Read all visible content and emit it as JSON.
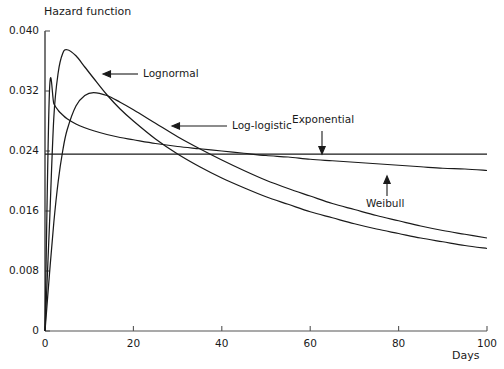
{
  "chart_data": {
    "type": "line",
    "title": "",
    "ylabel": "Hazard function",
    "xlabel": "Days",
    "xlim": [
      0,
      100
    ],
    "ylim": [
      0,
      0.04
    ],
    "grid": false,
    "legend_position": "inline-annotations",
    "xticks": [
      "0",
      "20",
      "40",
      "60",
      "80",
      "100"
    ],
    "xtick_values": [
      0,
      20,
      40,
      60,
      80,
      100
    ],
    "yticks": [
      "0",
      "0.008",
      "0.016",
      "0.024",
      "0.032",
      "0.040"
    ],
    "ytick_values": [
      0,
      0.008,
      0.016,
      0.024,
      0.032,
      0.04
    ],
    "x": [
      0,
      1,
      2,
      3,
      4,
      5,
      7,
      9,
      11,
      14,
      17,
      20,
      25,
      30,
      35,
      40,
      45,
      50,
      55,
      60,
      65,
      70,
      75,
      80,
      85,
      90,
      95,
      100
    ],
    "series": [
      {
        "name": "Lognormal",
        "values": [
          0.0,
          0.014,
          0.0285,
          0.0345,
          0.037,
          0.0375,
          0.0367,
          0.0352,
          0.0337,
          0.0315,
          0.0296,
          0.028,
          0.0256,
          0.0236,
          0.0219,
          0.0204,
          0.0191,
          0.0179,
          0.0169,
          0.0159,
          0.0151,
          0.0143,
          0.0136,
          0.013,
          0.0124,
          0.0119,
          0.0114,
          0.011
        ]
      },
      {
        "name": "Log-logistic",
        "values": [
          0.0,
          0.0075,
          0.0145,
          0.02,
          0.024,
          0.0268,
          0.03,
          0.0314,
          0.0318,
          0.0314,
          0.0305,
          0.0295,
          0.0277,
          0.0259,
          0.0243,
          0.0228,
          0.0214,
          0.0201,
          0.019,
          0.018,
          0.017,
          0.0162,
          0.0154,
          0.0147,
          0.014,
          0.0134,
          0.0129,
          0.0124
        ]
      },
      {
        "name": "Exponential",
        "values": [
          0.0236,
          0.0236,
          0.0236,
          0.0236,
          0.0236,
          0.0236,
          0.0236,
          0.0236,
          0.0236,
          0.0236,
          0.0236,
          0.0236,
          0.0236,
          0.0236,
          0.0236,
          0.0236,
          0.0236,
          0.0236,
          0.0236,
          0.0236,
          0.0236,
          0.0236,
          0.0236,
          0.0236,
          0.0236,
          0.0236,
          0.0236,
          0.0236
        ]
      },
      {
        "name": "Weibull",
        "values": [
          0.0,
          0.0318,
          0.0303,
          0.0294,
          0.0288,
          0.0283,
          0.0276,
          0.0271,
          0.0267,
          0.0262,
          0.0258,
          0.0255,
          0.025,
          0.0246,
          0.0243,
          0.024,
          0.0237,
          0.0234,
          0.0232,
          0.0229,
          0.0227,
          0.0225,
          0.0223,
          0.0221,
          0.0219,
          0.0217,
          0.0216,
          0.0214
        ]
      }
    ],
    "annotations": [
      {
        "label": "Lognormal",
        "arrow": "left"
      },
      {
        "label": "Log-logistic",
        "arrow": "left"
      },
      {
        "label": "Exponential",
        "arrow": "down"
      },
      {
        "label": "Weibull",
        "arrow": "up"
      }
    ]
  },
  "axis": {
    "y_title": "Hazard function",
    "x_title": "Days"
  },
  "labels": {
    "lognormal": "Lognormal",
    "loglogistic": "Log-logistic",
    "exponential": "Exponential",
    "weibull": "Weibull"
  },
  "colors": {
    "line": "#1a1a1a",
    "axis": "#555555",
    "background": "#ffffff"
  }
}
